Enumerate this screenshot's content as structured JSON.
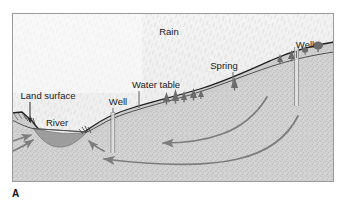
{
  "figure": {
    "panel_letter": "A",
    "frame": {
      "x": 12,
      "y": 13,
      "width": 322,
      "height": 169,
      "border_color": "#9a9a9a"
    },
    "colors": {
      "sky": "#f4f4f4",
      "rain_streak": "#dcdcdc",
      "ground_fill": "#d2d2d2",
      "ground_stipple": "#a8a8a8",
      "land_surface_line": "#1f1f1f",
      "water_table_line": "#4a4a4a",
      "river_water": "#9b9b9b",
      "flow_arrow": "#7d7d7d",
      "well_casing": "#8c8c8c",
      "tree": "#6e6e6e",
      "label_text": "#1a1a1a"
    },
    "labels": [
      {
        "id": "rain",
        "text": "Rain",
        "x": 169,
        "y": 35
      },
      {
        "id": "well-right",
        "text": "Well",
        "x": 305,
        "y": 48
      },
      {
        "id": "spring",
        "text": "Spring",
        "x": 224,
        "y": 69
      },
      {
        "id": "water-table",
        "text": "Water table",
        "x": 156,
        "y": 88
      },
      {
        "id": "land-surface",
        "text": "Land surface",
        "x": 48,
        "y": 99
      },
      {
        "id": "well-left",
        "text": "Well",
        "x": 118,
        "y": 105
      },
      {
        "id": "river",
        "text": "River",
        "x": 57,
        "y": 126
      }
    ],
    "features": {
      "rain_description": "Diagonal rain streaks falling over the entire sky",
      "wells": [
        {
          "id": "well-left",
          "surface_x": 113,
          "top_y": 114,
          "bottom_y": 152
        },
        {
          "id": "well-right",
          "surface_x": 297,
          "top_y": 50,
          "bottom_y": 105
        }
      ],
      "flow_arrows": [
        {
          "id": "flow-arrow-upper",
          "direction": "right-to-left",
          "description": "Curved groundwater flow path from recharge area toward river"
        },
        {
          "id": "flow-arrow-lower",
          "direction": "right-to-left",
          "description": "Deeper curved groundwater flow path toward river"
        },
        {
          "id": "flow-arrow-river-left",
          "direction": "left-to-right",
          "description": "Short discharge arrow into river from left bank"
        },
        {
          "id": "flow-arrow-river-right",
          "direction": "right-to-left",
          "description": "Short discharge arrow into river from right bank"
        }
      ],
      "trees": [
        {
          "x": 163,
          "y": 94
        },
        {
          "x": 172,
          "y": 92
        },
        {
          "x": 183,
          "y": 92
        },
        {
          "x": 194,
          "y": 90
        },
        {
          "x": 234,
          "y": 80
        },
        {
          "x": 281,
          "y": 55
        },
        {
          "x": 292,
          "y": 52
        },
        {
          "x": 320,
          "y": 46
        }
      ]
    }
  }
}
